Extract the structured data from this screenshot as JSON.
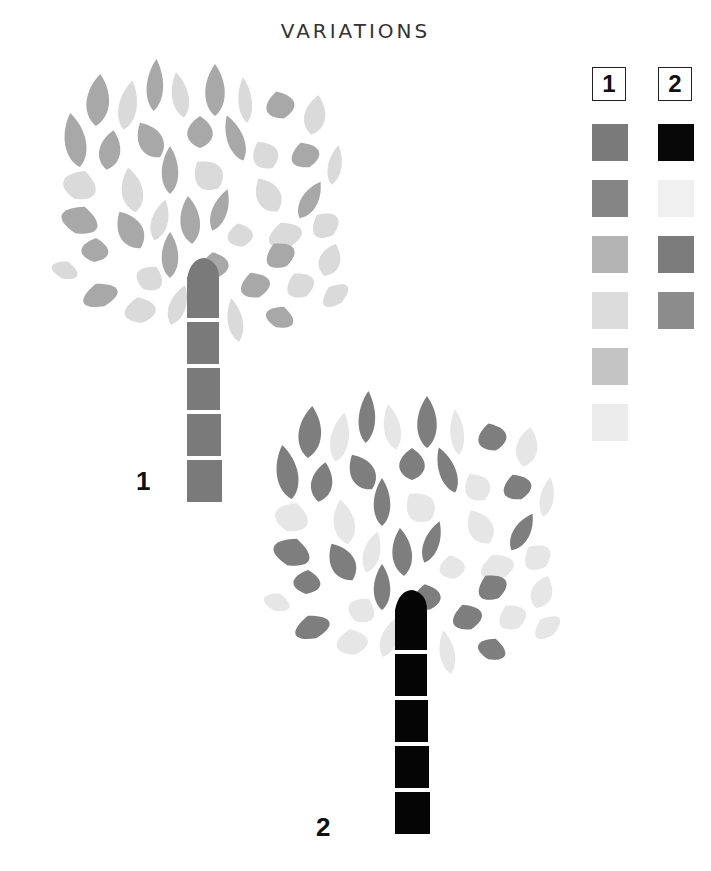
{
  "title": "VARIATIONS",
  "key": {
    "columns": [
      {
        "label": "1",
        "swatches": [
          "#7a7a7a",
          "#858585",
          "#b4b4b4",
          "#dcdcdc",
          "#c4c4c4",
          "#ececec"
        ]
      },
      {
        "label": "2",
        "swatches": [
          "#080808",
          "#f0f0f0",
          "#7c7c7c",
          "#8c8c8c"
        ]
      }
    ]
  },
  "trees": [
    {
      "label": "1",
      "colors": {
        "dark": "#a8a8a8",
        "light": "#dadada",
        "trunk": "#7a7a7a"
      },
      "origin": [
        40,
        60
      ],
      "trunk_segments": 5
    },
    {
      "label": "2",
      "colors": {
        "dark": "#7e7e7e",
        "light": "#e6e6e6",
        "trunk": "#050505"
      },
      "origin": [
        252,
        392
      ],
      "trunk_segments": 5
    }
  ]
}
